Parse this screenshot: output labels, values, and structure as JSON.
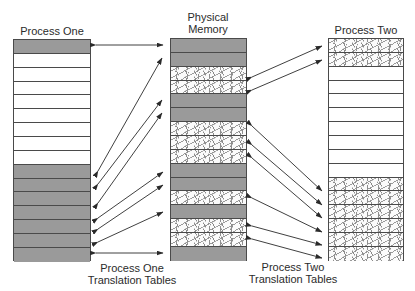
{
  "diagram": {
    "labels": {
      "process_one": "Process One",
      "physical_memory_line1": "Physical",
      "physical_memory_line2": "Memory",
      "process_two": "Process Two",
      "p1_tables_line1": "Process One",
      "p1_tables_line2": "Translation Tables",
      "p2_tables_line1": "Process Two",
      "p2_tables_line2": "Translation Tables"
    },
    "process_one_rows": [
      "dark",
      "white",
      "white",
      "white",
      "white",
      "white",
      "white",
      "white",
      "white",
      "dark",
      "dark",
      "dark",
      "dark",
      "dark",
      "dark",
      "dark"
    ],
    "physical_memory_rows": [
      "dark",
      "dark",
      "speckle",
      "speckle",
      "dark",
      "dark",
      "speckle",
      "speckle",
      "speckle",
      "dark",
      "dark",
      "speckle",
      "dark",
      "speckle",
      "speckle",
      "dark"
    ],
    "process_two_rows": [
      "speckle",
      "speckle",
      "white",
      "white",
      "white",
      "white",
      "white",
      "white",
      "white",
      "white",
      "speckle",
      "speckle",
      "speckle",
      "speckle",
      "speckle",
      "speckle"
    ],
    "colors": {
      "process_one_page": "#9a9a9a",
      "process_two_page": "#fbfbfb",
      "border": "#4a4a4a",
      "arrow": "#2a2a2a"
    }
  }
}
